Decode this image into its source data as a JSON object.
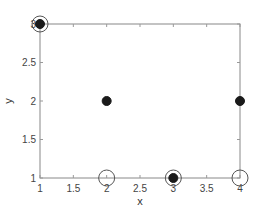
{
  "chart_data": {
    "type": "scatter",
    "title": "",
    "xlabel": "x",
    "ylabel": "y",
    "xlim": [
      1,
      4
    ],
    "ylim": [
      1,
      3
    ],
    "xticks": [
      1,
      1.5,
      2,
      2.5,
      3,
      3.5,
      4
    ],
    "yticks": [
      1,
      1.5,
      2,
      2.5,
      3
    ],
    "xtick_labels": [
      "1",
      "1.5",
      "2",
      "2.5",
      "3",
      "3.5",
      "4"
    ],
    "ytick_labels": [
      "1",
      "1.5",
      "2",
      "2.5",
      "3"
    ],
    "grid": false,
    "legend": null,
    "series": [
      {
        "name": "filled",
        "marker": "filled-circle",
        "color": "#1a1a1a",
        "x": [
          1,
          2,
          3,
          4
        ],
        "y": [
          3,
          2,
          1,
          2
        ]
      },
      {
        "name": "open",
        "marker": "open-circle",
        "color": "#555555",
        "x": [
          1,
          2,
          3,
          4
        ],
        "y": [
          3,
          1,
          1,
          1
        ]
      }
    ]
  },
  "axes": {
    "box_color": "#888888"
  }
}
